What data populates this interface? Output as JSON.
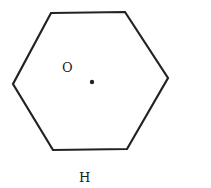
{
  "diagram": {
    "shape": "hexagon",
    "center_label": "O",
    "caption": "H",
    "colors": {
      "stroke": "#222222",
      "background": "#ffffff"
    }
  }
}
